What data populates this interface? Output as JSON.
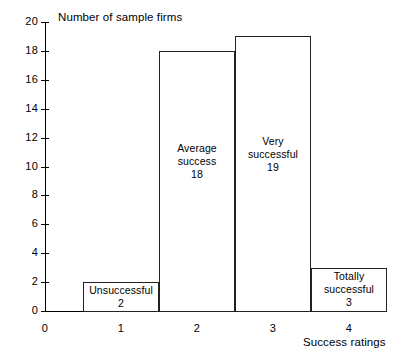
{
  "chart": {
    "y_axis_title": "Number of sample firms",
    "x_axis_title": "Success ratings",
    "y_ticks": [
      {
        "value": 20,
        "label": "20"
      },
      {
        "value": 18,
        "label": "18"
      },
      {
        "value": 16,
        "label": "16"
      },
      {
        "value": 14,
        "label": "14"
      },
      {
        "value": 12,
        "label": "12"
      },
      {
        "value": 10,
        "label": "10"
      },
      {
        "value": 8,
        "label": "8"
      },
      {
        "value": 6,
        "label": "6"
      },
      {
        "value": 4,
        "label": "4"
      },
      {
        "value": 2,
        "label": "2"
      },
      {
        "value": 0,
        "label": "0"
      }
    ],
    "x_ticks": [
      {
        "value": 0,
        "label": "0"
      },
      {
        "value": 1,
        "label": "1"
      },
      {
        "value": 2,
        "label": "2"
      },
      {
        "value": 3,
        "label": "3"
      },
      {
        "value": 4,
        "label": "4"
      }
    ],
    "bars": [
      {
        "rating": 1,
        "name": "Unsuccessful",
        "value": 2,
        "label": "Unsuccessful\n2"
      },
      {
        "rating": 2,
        "name": "Average success",
        "value": 18,
        "label": "Average\nsuccess\n18"
      },
      {
        "rating": 3,
        "name": "Very successful",
        "value": 19,
        "label": "Very\nsuccessful\n19"
      },
      {
        "rating": 4,
        "name": "Totally successful",
        "value": 3,
        "label": "Totally\nsuccessful\n3"
      }
    ]
  },
  "chart_data": {
    "type": "bar",
    "title": "",
    "categories": [
      "Unsuccessful",
      "Average success",
      "Very successful",
      "Totally successful"
    ],
    "x": [
      1,
      2,
      3,
      4
    ],
    "values": [
      2,
      18,
      19,
      3
    ],
    "xlabel": "Success ratings",
    "ylabel": "Number of sample firms",
    "ylim": [
      0,
      20
    ],
    "xlim": [
      0,
      4.5
    ],
    "ytick_step": 2,
    "xticks": [
      0,
      1,
      2,
      3,
      4
    ],
    "yticks": [
      0,
      2,
      4,
      6,
      8,
      10,
      12,
      14,
      16,
      18,
      20
    ],
    "grid": false,
    "legend": false,
    "bar_style": "histogram-contiguous-outline",
    "colors": {
      "background": "#ffffff",
      "axis": "#000000",
      "bar_outline": "#222222",
      "bar_fill": "none",
      "text": "#000000"
    },
    "annotations": [
      {
        "x": 1,
        "text": "Unsuccessful 2"
      },
      {
        "x": 2,
        "text": "Average success 18"
      },
      {
        "x": 3,
        "text": "Very successful 19"
      },
      {
        "x": 4,
        "text": "Totally successful 3"
      }
    ]
  }
}
